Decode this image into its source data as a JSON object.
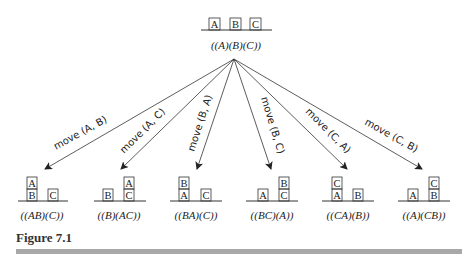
{
  "root": {
    "label": "((A)(B)(C))",
    "blocks": [
      [
        "A"
      ],
      [
        "B"
      ],
      [
        "C"
      ]
    ]
  },
  "edges": [
    {
      "label": "move (A, B)",
      "child": 0
    },
    {
      "label": "move (A, C)",
      "child": 1
    },
    {
      "label": "move (B, A)",
      "child": 2
    },
    {
      "label": "move (B, C)",
      "child": 3
    },
    {
      "label": "move (C, A)",
      "child": 4
    },
    {
      "label": "move (C, B)",
      "child": 5
    }
  ],
  "children": [
    {
      "label": "((AB)(C))",
      "stacks": [
        [
          "B",
          "A"
        ],
        [
          "C"
        ]
      ]
    },
    {
      "label": "((B)(AC))",
      "stacks": [
        [
          "B"
        ],
        [
          "C",
          "A"
        ]
      ]
    },
    {
      "label": "((BA)(C))",
      "stacks": [
        [
          "A",
          "B"
        ],
        [
          "C"
        ]
      ]
    },
    {
      "label": "((BC)(A))",
      "stacks": [
        [
          "A"
        ],
        [
          "C",
          "B"
        ]
      ]
    },
    {
      "label": "((CA)(B))",
      "stacks": [
        [
          "A",
          "C"
        ],
        [
          "B"
        ]
      ]
    },
    {
      "label": "((A)(CB))",
      "stacks": [
        [
          "A"
        ],
        [
          "B",
          "C"
        ]
      ]
    }
  ],
  "caption": "Figure 7.1"
}
